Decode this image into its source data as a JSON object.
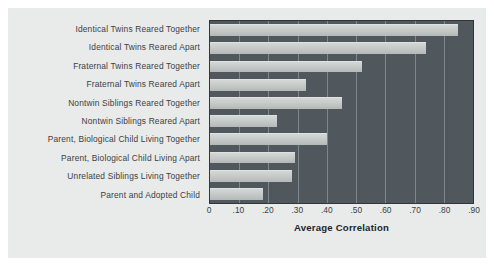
{
  "chart_data": {
    "type": "bar",
    "orientation": "horizontal",
    "title": "",
    "xlabel": "Average Correlation",
    "ylabel": "",
    "xlim": [
      0,
      0.9
    ],
    "grid": true,
    "legend": "none",
    "tick_labels": [
      "0",
      ".10",
      ".20",
      ".30",
      ".40",
      ".50",
      ".60",
      ".70",
      ".80",
      ".90"
    ],
    "tick_values": [
      0,
      0.1,
      0.2,
      0.3,
      0.4,
      0.5,
      0.6,
      0.7,
      0.8,
      0.9
    ],
    "categories": [
      "Identical Twins Reared Together",
      "Identical Twins Reared Apart",
      "Fraternal Twins Reared Together",
      "Fraternal Twins Reared Apart",
      "Nontwin Siblings Reared Together",
      "Nontwin Siblings Reared Apart",
      "Parent, Biological Child Living Together",
      "Parent, Biological Child Living Apart",
      "Unrelated Siblings Living Together",
      "Parent and Adopted Child"
    ],
    "values": [
      0.85,
      0.74,
      0.52,
      0.33,
      0.45,
      0.23,
      0.4,
      0.29,
      0.28,
      0.18
    ]
  },
  "style": {
    "figure_background": "#e9eaea",
    "page_background": "#ffffff",
    "plot_background": "#50585e",
    "bar_color": "#c3c8c6",
    "gridline_color": "#9aa1a5",
    "text_color": "#3b3f42"
  }
}
